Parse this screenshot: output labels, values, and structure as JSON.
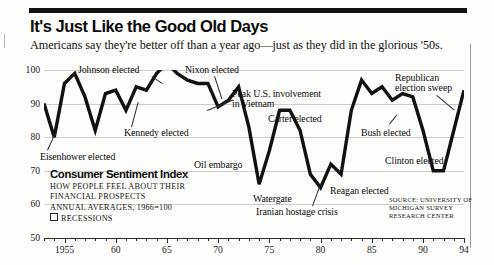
{
  "headline": "It's Just Like the Good Old Days",
  "subhead": "Americans say they're better off than a year ago—just as they did in the glorious '50s.",
  "legend": {
    "title": "Consumer Sentiment Index",
    "line1": "How people feel about their",
    "line2": "financial prospects",
    "line3": "Annual averages, 1966=100",
    "recessions_label": "Recessions"
  },
  "source": "Source: University of Michigan Survey Research Center",
  "chart_data": {
    "type": "line",
    "title": "It's Just Like the Good Old Days",
    "subtitle": "Americans say they're better off than a year ago—just as they did in the glorious '50s.",
    "xlabel": "",
    "ylabel": "Consumer Sentiment Index",
    "xlim": [
      1953,
      1994
    ],
    "ylim": [
      50,
      100
    ],
    "yticks": [
      50,
      60,
      70,
      80,
      90,
      100
    ],
    "ytick_labels": [
      "50",
      "60",
      "70",
      "80",
      "90",
      "100"
    ],
    "xticks": [
      1955,
      1960,
      1965,
      1970,
      1975,
      1980,
      1985,
      1990,
      1994
    ],
    "xtick_labels": [
      "1955",
      "60",
      "65",
      "70",
      "75",
      "80",
      "85",
      "90",
      "94"
    ],
    "grid": true,
    "legend_position": "none",
    "series": [
      {
        "name": "Consumer Sentiment Index",
        "x": [
          1953,
          1954,
          1955,
          1956,
          1957,
          1958,
          1959,
          1960,
          1961,
          1962,
          1963,
          1964,
          1965,
          1966,
          1967,
          1968,
          1969,
          1970,
          1971,
          1972,
          1973,
          1974,
          1975,
          1976,
          1977,
          1978,
          1979,
          1980,
          1981,
          1982,
          1983,
          1984,
          1985,
          1986,
          1987,
          1988,
          1989,
          1990,
          1991,
          1992,
          1993,
          1994
        ],
        "values": [
          90,
          80,
          96,
          99,
          92,
          82,
          93,
          94,
          88,
          95,
          94,
          99,
          102,
          99,
          97,
          96,
          96,
          89,
          91,
          95,
          83,
          66,
          76,
          88,
          88,
          82,
          69,
          65,
          72,
          69,
          88,
          97,
          93,
          95,
          91,
          93,
          92,
          82,
          70,
          70,
          82,
          94
        ]
      }
    ],
    "annotations": [
      {
        "label": "Eisenhower elected",
        "year": 1953,
        "value": 90
      },
      {
        "label": "Kennedy elected",
        "year": 1961,
        "value": 88
      },
      {
        "label": "Johnson elected",
        "year": 1964,
        "value": 99
      },
      {
        "label": "Nixon elected",
        "year": 1969,
        "value": 96
      },
      {
        "label": "Peak U.S. involvement\nin Vietnam",
        "year": 1968,
        "value": 96
      },
      {
        "label": "Oil embargo",
        "year": 1974,
        "value": 66
      },
      {
        "label": "Carter elected",
        "year": 1977,
        "value": 88
      },
      {
        "label": "Watergate",
        "year": 1974,
        "value": 66
      },
      {
        "label": "Iranian hostage crisis",
        "year": 1980,
        "value": 65
      },
      {
        "label": "Reagan elected",
        "year": 1981,
        "value": 72
      },
      {
        "label": "Bush elected",
        "year": 1989,
        "value": 92
      },
      {
        "label": "Clinton elected",
        "year": 1992,
        "value": 70
      },
      {
        "label": "Republican\nelection sweep",
        "year": 1994,
        "value": 94
      }
    ]
  },
  "annotation_text": {
    "eisenhower": "Eisenhower elected",
    "kennedy": "Kennedy elected",
    "johnson": "Johnson elected",
    "nixon": "Nixon elected",
    "vietnam_l1": "Peak U.S. involvement",
    "vietnam_l2": "in Vietnam",
    "oil": "Oil embargo",
    "carter": "Carter elected",
    "watergate": "Watergate",
    "iran": "Iranian hostage crisis",
    "reagan": "Reagan elected",
    "bush": "Bush elected",
    "clinton": "Clinton elected",
    "gop_l1": "Republican",
    "gop_l2": "election sweep"
  }
}
